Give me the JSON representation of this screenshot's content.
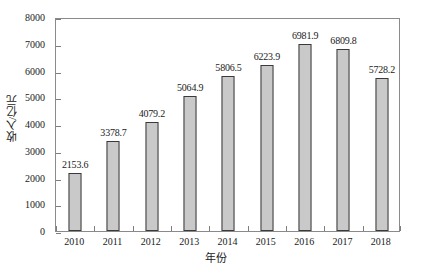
{
  "chart_data": {
    "type": "bar",
    "title": "",
    "subtitle": "",
    "xlabel": "年份",
    "ylabel": "收入/亿元",
    "categories": [
      "2010",
      "2011",
      "2012",
      "2013",
      "2014",
      "2015",
      "2016",
      "2017",
      "2018"
    ],
    "values": [
      2153.6,
      3378.7,
      4079.2,
      5064.9,
      5806.5,
      6223.9,
      6981.9,
      6809.8,
      5728.2
    ],
    "data_labels": [
      "2153.6",
      "3378.7",
      "4079.2",
      "5064.9",
      "5806.5",
      "6223.9",
      "6981.9",
      "6809.8",
      "5728.2"
    ],
    "ylim": [
      0,
      8000
    ],
    "y_ticks": [
      0,
      1000,
      2000,
      3000,
      4000,
      5000,
      6000,
      7000,
      8000
    ],
    "y_tick_labels": [
      "0",
      "1000",
      "2000",
      "3000",
      "4000",
      "5000",
      "6000",
      "7000",
      "8000"
    ],
    "grid": false,
    "legend": null,
    "legend_position": "none",
    "series": [
      {
        "name": "收入/亿元",
        "values": [
          2153.6,
          3378.7,
          4079.2,
          5064.9,
          5806.5,
          6223.9,
          6981.9,
          6809.8,
          5728.2
        ]
      }
    ],
    "colors": {
      "bar_fill": "#c9c9c9",
      "bar_edge": "#3a3a3a",
      "axis": "#8a8a8a",
      "text": "#1a1a1a",
      "background": "#ffffff"
    }
  }
}
